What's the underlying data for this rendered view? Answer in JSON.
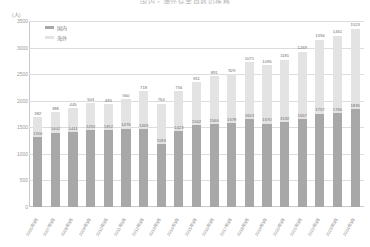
{
  "chart_data": {
    "type": "bar",
    "stacked": true,
    "title": "国内・海外従業員数の推移",
    "subtitle": "",
    "xlabel": "",
    "ylabel": "(人)",
    "yunit": "(人)",
    "ylim": [
      0,
      3500
    ],
    "ytick_step": 500,
    "yticks": [
      "3500",
      "3000",
      "2500",
      "2000",
      "1500",
      "1000",
      "500",
      "0"
    ],
    "grid": true,
    "legend_position": "top-left",
    "categories": [
      "2006年3月",
      "2007年3月",
      "2008年3月",
      "2009年3月",
      "2010年3月",
      "2011年3月",
      "2012年3月",
      "2013年3月",
      "2014年3月",
      "2015年3月",
      "2016年3月",
      "2017年3月",
      "2018年3月",
      "2019年3月",
      "2020年3月",
      "2021年3月",
      "2022年3月",
      "2023年3月",
      "2024年3月"
    ],
    "series": [
      {
        "name": "国内",
        "color": "#a8a8a8",
        "values": [
          1316,
          1402,
          1411,
          1452,
          1452,
          1476,
          1469,
          1183,
          1423,
          1542,
          1566,
          1578,
          1653,
          1570,
          1592,
          1657,
          1757,
          1766,
          1836
        ]
      },
      {
        "name": "海外",
        "color": "#e3e3e3",
        "values": [
          382,
          388,
          445,
          503,
          483,
          560,
          718,
          764,
          756,
          811,
          891,
          929,
          1071,
          1095,
          1181,
          1269,
          1394,
          1461,
          1523
        ]
      }
    ]
  },
  "legend": {
    "items": [
      {
        "label": "国内",
        "color": "#a8a8a8"
      },
      {
        "label": "海外",
        "color": "#e3e3e3"
      }
    ]
  }
}
